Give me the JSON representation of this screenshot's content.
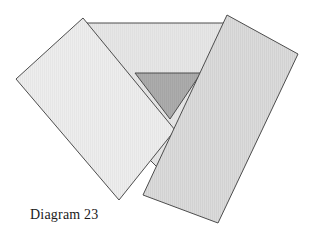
{
  "figure": {
    "caption": "Diagram 23",
    "background_color": "#ffffff",
    "stroke_color": "#4d4d4d",
    "stroke_width": 1
  },
  "shapes": {
    "back_panel": {
      "name": "back-panel",
      "description": "Large light background quadrilateral forming the V-shaped recess behind the two flaps",
      "fill": "#e3e3e3",
      "points": "85,23 227,23 227,120 170,180 110,120"
    },
    "inner_triangle": {
      "name": "inner-triangle",
      "description": "Darker downward-pointing triangle at the centre of the V recess",
      "fill": "#a9a9a9",
      "points": "135,73 201,73 170,119"
    },
    "left_flap": {
      "name": "left-flap",
      "description": "Light rotated rectangle occupying the left side",
      "fill": "#eaeaea",
      "points": "83,18 175,130 119,200 16,79"
    },
    "right_flap": {
      "name": "right-flap",
      "description": "Medium grey rotated rectangle occupying the right side, overlapping the left flap",
      "fill": "#d7d7d7",
      "points": "227,15 298,54 218,223 143,195"
    }
  },
  "colors": {
    "left_flap_fill": "#eaeaea",
    "right_flap_fill": "#d7d7d7",
    "back_panel_fill": "#e3e3e3",
    "inner_triangle_fill": "#a9a9a9",
    "outline": "#4d4d4d",
    "caption_text": "#1a1a1a"
  }
}
